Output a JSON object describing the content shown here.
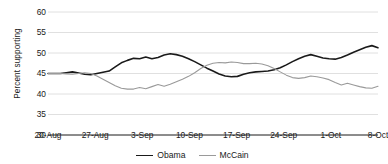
{
  "chart_data": {
    "type": "line",
    "title": "",
    "xlabel": "",
    "ylabel": "Percent supporting",
    "ylim": [
      30,
      60
    ],
    "yticks": [
      30,
      35,
      40,
      45,
      50,
      55,
      60
    ],
    "grid": true,
    "legend_position": "bottom-center",
    "categories": [
      "20-Aug",
      "27-Aug",
      "3-Sep",
      "10-Sep",
      "17-Sep",
      "24-Sep",
      "1-Oct",
      "8-Oct"
    ],
    "xtick_labels": [
      "20-Aug",
      "27-Aug",
      "3-Sep",
      "10-Sep",
      "17-Sep",
      "24-Sep",
      "1-Oct",
      "8-Oct"
    ],
    "series": [
      {
        "name": "Obama",
        "color": "#1a1a1a",
        "x": [
          0,
          1,
          2,
          3,
          4,
          5,
          6,
          7,
          8,
          9,
          10,
          11,
          12,
          13,
          14,
          15,
          16,
          17,
          18,
          19,
          20,
          21,
          22,
          23,
          24,
          25,
          26,
          27,
          28,
          29,
          30,
          31,
          32,
          33,
          34,
          35,
          36,
          37,
          38,
          39,
          40,
          41,
          42,
          43,
          44,
          45,
          46,
          47,
          48,
          49,
          50,
          51,
          52,
          53,
          54
        ],
        "values": [
          45.0,
          45.0,
          45.0,
          45.2,
          45.4,
          45.1,
          44.8,
          44.7,
          45.0,
          45.3,
          45.6,
          46.6,
          47.6,
          48.2,
          48.7,
          48.6,
          49.0,
          48.6,
          48.9,
          49.5,
          49.8,
          49.6,
          49.2,
          48.6,
          47.9,
          47.1,
          46.3,
          45.6,
          44.9,
          44.4,
          44.2,
          44.3,
          44.8,
          45.2,
          45.4,
          45.5,
          45.6,
          45.9,
          46.4,
          47.1,
          47.9,
          48.6,
          49.2,
          49.6,
          49.2,
          48.8,
          48.6,
          48.5,
          48.9,
          49.5,
          50.2,
          50.8,
          51.4,
          51.8,
          51.3
        ]
      },
      {
        "name": "McCain",
        "color": "#9a9a9a",
        "x": [
          0,
          1,
          2,
          3,
          4,
          5,
          6,
          7,
          8,
          9,
          10,
          11,
          12,
          13,
          14,
          15,
          16,
          17,
          18,
          19,
          20,
          21,
          22,
          23,
          24,
          25,
          26,
          27,
          28,
          29,
          30,
          31,
          32,
          33,
          34,
          35,
          36,
          37,
          38,
          39,
          40,
          41,
          42,
          43,
          44,
          45,
          46,
          47,
          48,
          49,
          50,
          51,
          52,
          53,
          54
        ],
        "values": [
          45.0,
          45.0,
          45.0,
          44.9,
          44.8,
          45.0,
          45.2,
          45.0,
          44.4,
          43.6,
          42.8,
          42.0,
          41.4,
          41.2,
          41.2,
          41.6,
          41.3,
          41.8,
          42.3,
          41.9,
          42.4,
          43.0,
          43.6,
          44.3,
          45.2,
          46.2,
          47.0,
          47.5,
          47.7,
          47.6,
          47.8,
          47.7,
          47.4,
          47.4,
          47.5,
          47.3,
          46.9,
          46.2,
          45.4,
          44.6,
          44.0,
          43.8,
          44.0,
          44.4,
          44.2,
          43.9,
          43.5,
          42.8,
          42.2,
          42.6,
          42.2,
          41.8,
          41.5,
          41.4,
          41.9
        ]
      }
    ],
    "annotations": []
  },
  "legend": {
    "items": [
      {
        "label": "Obama",
        "color": "#1a1a1a"
      },
      {
        "label": "McCain",
        "color": "#9a9a9a"
      }
    ]
  },
  "axes": {
    "y_title": "Percent supporting"
  }
}
